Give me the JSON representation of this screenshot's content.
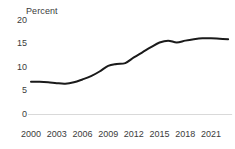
{
  "chart_data": {
    "type": "line",
    "title": "",
    "subtitle": "",
    "xlabel": "",
    "ylabel": "Percent",
    "unit_label": "Percent",
    "xlim": [
      2000,
      2023
    ],
    "ylim": [
      0,
      20
    ],
    "grid": false,
    "legend": null,
    "legend_position": "none",
    "line_color": "#1a1a1a",
    "axis_color": "#d9d9d9",
    "text_color": "#3b3b3b",
    "ytick_labels": [
      "20",
      "15",
      "10",
      "5",
      "0"
    ],
    "ytick_values": [
      20,
      15,
      10,
      5,
      0
    ],
    "xtick_labels": [
      "2000",
      "2003",
      "2006",
      "2009",
      "2012",
      "2015",
      "2018",
      "2021"
    ],
    "xtick_values": [
      2000,
      2003,
      2006,
      2009,
      2012,
      2015,
      2018,
      2021
    ],
    "x": [
      2000,
      2001,
      2002,
      2003,
      2004,
      2005,
      2006,
      2007,
      2008,
      2009,
      2010,
      2011,
      2012,
      2013,
      2014,
      2015,
      2016,
      2017,
      2018,
      2019,
      2020,
      2021,
      2022,
      2023
    ],
    "values": [
      7.0,
      7.0,
      6.9,
      6.7,
      6.6,
      6.9,
      7.5,
      8.2,
      9.2,
      10.4,
      10.8,
      11.0,
      12.2,
      13.3,
      14.4,
      15.4,
      15.8,
      15.4,
      15.8,
      16.1,
      16.3,
      16.3,
      16.2,
      16.1
    ],
    "series": [
      {
        "name": "Percent",
        "values": [
          7.0,
          7.0,
          6.9,
          6.7,
          6.6,
          6.9,
          7.5,
          8.2,
          9.2,
          10.4,
          10.8,
          11.0,
          12.2,
          13.3,
          14.4,
          15.4,
          15.8,
          15.4,
          15.8,
          16.1,
          16.3,
          16.3,
          16.2,
          16.1
        ]
      }
    ]
  }
}
